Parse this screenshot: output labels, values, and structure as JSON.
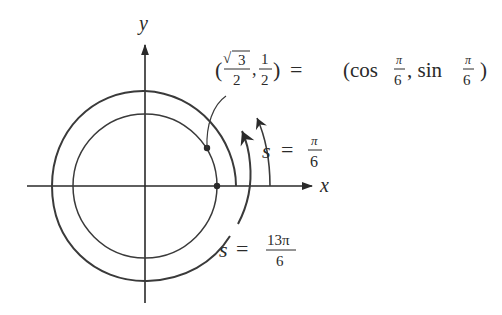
{
  "diagram": {
    "type": "unit-circle-arc-length",
    "axes": {
      "x_label": "x",
      "y_label": "y",
      "origin": [
        145,
        186
      ]
    },
    "inner_circle": {
      "radius": 72,
      "color": "#3a3a3a"
    },
    "outer_spiral": {
      "start_radius": 91,
      "end_radius": 106,
      "color": "#3a3a3a"
    },
    "point": {
      "label_left_paren": "(",
      "sqrt_symbol": "√",
      "sqrt_arg": "3",
      "frac1_den": "2",
      "comma": ",",
      "frac2_num": "1",
      "frac2_den": "2",
      "right_paren": ")",
      "equals": "=",
      "rhs_open": "(cos",
      "pi_symbol": "π",
      "six": "6",
      "rhs_mid": ", sin",
      "rhs_close": ")"
    },
    "arc_labels": {
      "small": {
        "var": "s",
        "equals": "=",
        "num": "π",
        "den": "6"
      },
      "large": {
        "var": "s",
        "equals": "=",
        "num": "13π",
        "den": "6"
      }
    },
    "colors": {
      "ink": "#2a2a2a",
      "background": "#ffffff"
    }
  }
}
